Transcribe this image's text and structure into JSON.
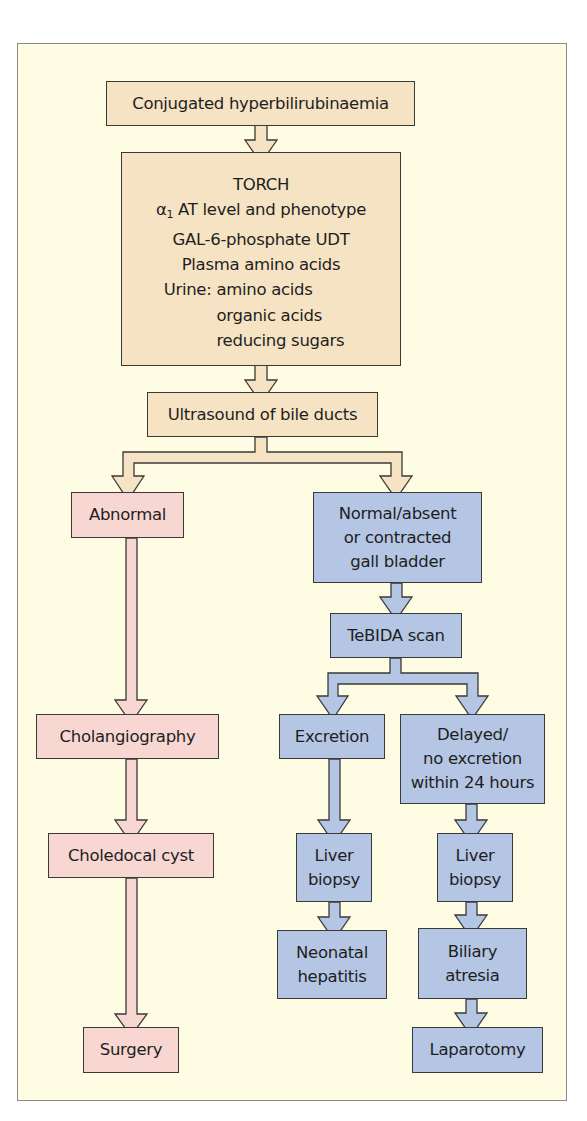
{
  "diagram": {
    "colors": {
      "background": "#fefce2",
      "frame_border": "#8a8a80",
      "tan_box": "#f6e3c4",
      "pink_box": "#f8d7d3",
      "blue_box": "#b4c6e4",
      "box_border": "#3a3a3a"
    },
    "nodes": {
      "start": {
        "label": "Conjugated hyperbilirubinaemia"
      },
      "tests": {
        "line1": "TORCH",
        "alpha_symbol": "α",
        "alpha_sub": "1",
        "line2_rest": " AT level and phenotype",
        "line3": "GAL-6-phosphate UDT",
        "line4": "Plasma amino acids",
        "urine_label": "Urine:",
        "urine_items": [
          "amino acids",
          "organic acids",
          "reducing sugars"
        ]
      },
      "ultrasound": {
        "label": "Ultrasound of bile ducts"
      },
      "abnormal": {
        "label": "Abnormal"
      },
      "cholangiography": {
        "label": "Cholangiography"
      },
      "choledocal_cyst": {
        "label": "Choledocal cyst"
      },
      "surgery": {
        "label": "Surgery"
      },
      "normal": {
        "line1": "Normal/absent",
        "line2": "or contracted",
        "line3": "gall bladder"
      },
      "tebida": {
        "label": "TeBIDA scan"
      },
      "excretion": {
        "label": "Excretion"
      },
      "delayed": {
        "line1": "Delayed/",
        "line2": "no excretion",
        "line3": "within 24 hours"
      },
      "liver_biopsy_1": {
        "line1": "Liver",
        "line2": "biopsy"
      },
      "liver_biopsy_2": {
        "line1": "Liver",
        "line2": "biopsy"
      },
      "neonatal_hepatitis": {
        "line1": "Neonatal",
        "line2": "hepatitis"
      },
      "biliary_atresia": {
        "line1": "Biliary",
        "line2": "atresia"
      },
      "laparotomy": {
        "label": "Laparotomy"
      }
    },
    "edges": [
      [
        "start",
        "tests"
      ],
      [
        "tests",
        "ultrasound"
      ],
      [
        "ultrasound",
        "abnormal"
      ],
      [
        "ultrasound",
        "normal"
      ],
      [
        "abnormal",
        "cholangiography"
      ],
      [
        "cholangiography",
        "choledocal_cyst"
      ],
      [
        "choledocal_cyst",
        "surgery"
      ],
      [
        "normal",
        "tebida"
      ],
      [
        "tebida",
        "excretion"
      ],
      [
        "tebida",
        "delayed"
      ],
      [
        "excretion",
        "liver_biopsy_1"
      ],
      [
        "liver_biopsy_1",
        "neonatal_hepatitis"
      ],
      [
        "delayed",
        "liver_biopsy_2"
      ],
      [
        "liver_biopsy_2",
        "biliary_atresia"
      ],
      [
        "biliary_atresia",
        "laparotomy"
      ]
    ]
  }
}
